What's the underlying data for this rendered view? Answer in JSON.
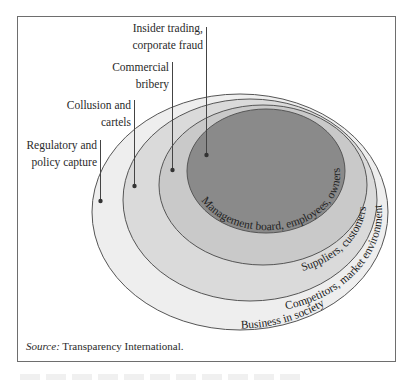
{
  "diagram": {
    "source_label": "Source:",
    "source_text": " Transparency International.",
    "rings": [
      {
        "id": "business-in-society",
        "label": "Business in society",
        "fill": "#eeeeee"
      },
      {
        "id": "competitors",
        "label": "Competitors, market environment",
        "fill": "#dadada"
      },
      {
        "id": "suppliers",
        "label": "Suppliers, customers",
        "fill": "#c9c9c9"
      },
      {
        "id": "management",
        "label": "Management board, employees, owners",
        "fill": "#8a8a8a"
      }
    ],
    "callouts": [
      {
        "id": "insider-trading",
        "lines": [
          "Insider trading,",
          "corporate fraud"
        ],
        "points_to": "management"
      },
      {
        "id": "commercial-bribery",
        "lines": [
          "Commercial",
          "bribery"
        ],
        "points_to": "suppliers"
      },
      {
        "id": "collusion",
        "lines": [
          "Collusion and",
          "cartels"
        ],
        "points_to": "competitors"
      },
      {
        "id": "regulatory-capture",
        "lines": [
          "Regulatory and",
          "policy capture"
        ],
        "points_to": "business-in-society"
      }
    ],
    "stroke_color": "#555555",
    "frame_color": "#6e6e6e"
  }
}
